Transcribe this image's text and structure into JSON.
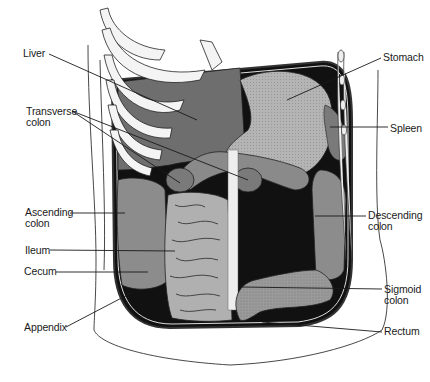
{
  "diagram": {
    "labels": [
      {
        "id": "liver",
        "text": "Liver",
        "x": 23,
        "y": 48
      },
      {
        "id": "transverse-colon",
        "text": "Transverse\ncolon",
        "x": 26,
        "y": 106
      },
      {
        "id": "ascending-colon",
        "text": "Ascending\ncolon",
        "x": 25,
        "y": 207
      },
      {
        "id": "ileum",
        "text": "Ileum",
        "x": 25,
        "y": 245
      },
      {
        "id": "cecum",
        "text": "Cecum",
        "x": 24,
        "y": 266
      },
      {
        "id": "appendix",
        "text": "Appendix",
        "x": 24,
        "y": 322
      },
      {
        "id": "stomach",
        "text": "Stomach",
        "x": 383,
        "y": 52
      },
      {
        "id": "spleen",
        "text": "Spleen",
        "x": 390,
        "y": 123
      },
      {
        "id": "descending-colon",
        "text": "Descending\ncolon",
        "x": 368,
        "y": 210
      },
      {
        "id": "sigmoid-colon",
        "text": "Sigmoid\ncolon",
        "x": 384,
        "y": 284
      },
      {
        "id": "rectum",
        "text": "Rectum",
        "x": 384,
        "y": 326
      }
    ],
    "colors": {
      "organ_dark": "#6e6e6e",
      "organ_mid": "#8c8c8c",
      "organ_light": "#a8a8a8",
      "cavity_black": "#111111",
      "rib_white": "#f4f4f4",
      "outline": "#222222"
    }
  }
}
